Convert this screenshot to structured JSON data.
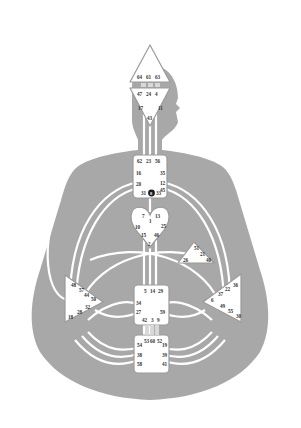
{
  "diagram": {
    "type": "human-design-bodygraph",
    "colors": {
      "background": "#ffffff",
      "body": "#a8a8a8",
      "channel": "#ffffff",
      "center_fill": "#ffffff",
      "center_stroke": "#9a9a9a",
      "text": "#333333",
      "marker": "#1a1a1a"
    },
    "centers": {
      "head": {
        "gates": [
          "64",
          "61",
          "63"
        ]
      },
      "ajna": {
        "gates": [
          "47",
          "24",
          "4",
          "17",
          "11",
          "43"
        ]
      },
      "throat": {
        "gates": [
          "62",
          "23",
          "56",
          "16",
          "35",
          "20",
          "12",
          "31",
          "8",
          "33",
          "45"
        ]
      },
      "g": {
        "gates": [
          "7",
          "1",
          "13",
          "10",
          "25",
          "15",
          "46",
          "2"
        ]
      },
      "ego": {
        "gates": [
          "51",
          "21",
          "26",
          "40"
        ]
      },
      "spleen": {
        "gates": [
          "48",
          "57",
          "44",
          "50",
          "32",
          "28",
          "18"
        ]
      },
      "solar_plexus": {
        "gates": [
          "36",
          "22",
          "37",
          "6",
          "49",
          "55",
          "30"
        ]
      },
      "sacral": {
        "gates": [
          "5",
          "14",
          "29",
          "34",
          "27",
          "59",
          "42",
          "3",
          "9"
        ]
      },
      "root": {
        "gates": [
          "53",
          "60",
          "52",
          "54",
          "19",
          "38",
          "39",
          "58",
          "41"
        ]
      }
    },
    "marker": {
      "gate": "8",
      "label": "8"
    }
  }
}
